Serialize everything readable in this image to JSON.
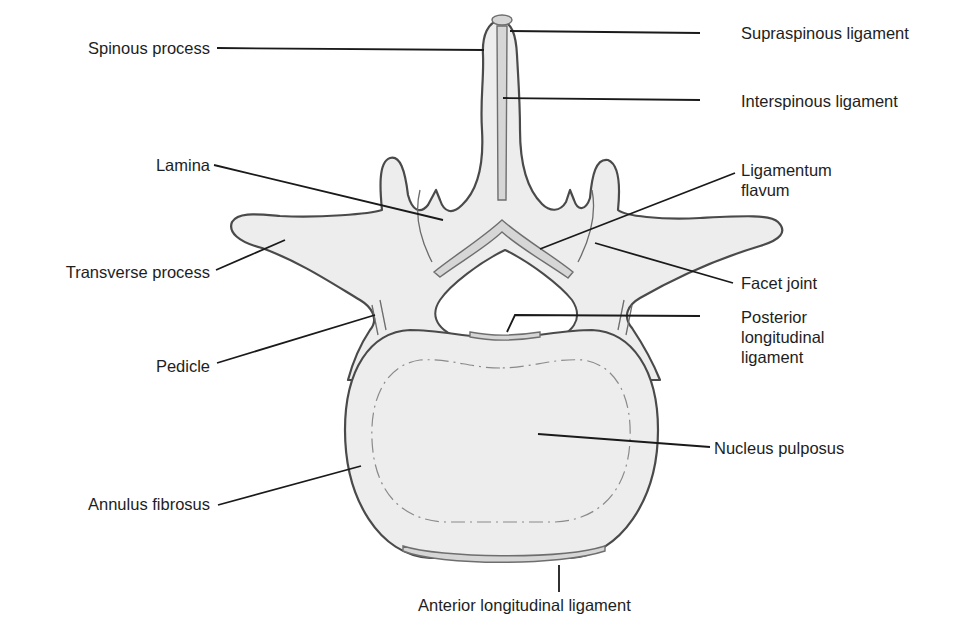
{
  "figure": {
    "colors": {
      "bone_fill": "#ededed",
      "outline": "#4a4a4a",
      "ligament_fill": "#d6d6d6",
      "leader_line": "#1a1a1a",
      "text": "#1e1e1e"
    }
  },
  "labels": {
    "left": {
      "spinous_process": "Spinous process",
      "lamina": "Lamina",
      "transverse_process": "Transverse process",
      "pedicle": "Pedicle",
      "annulus_fibrosus": "Annulus fibrosus"
    },
    "right": {
      "supraspinous_ligament": "Supraspinous ligament",
      "interspinous_ligament": "Interspinous ligament",
      "ligamentum_flavum_line1": "Ligamentum",
      "ligamentum_flavum_line2": "flavum",
      "facet_joint": "Facet joint",
      "posterior_longitudinal_ligament_line1": "Posterior",
      "posterior_longitudinal_ligament_line2": "longitudinal",
      "posterior_longitudinal_ligament_line3": "ligament",
      "nucleus_pulposus": "Nucleus pulposus"
    },
    "bottom": {
      "anterior_longitudinal_ligament": "Anterior longitudinal ligament"
    }
  }
}
